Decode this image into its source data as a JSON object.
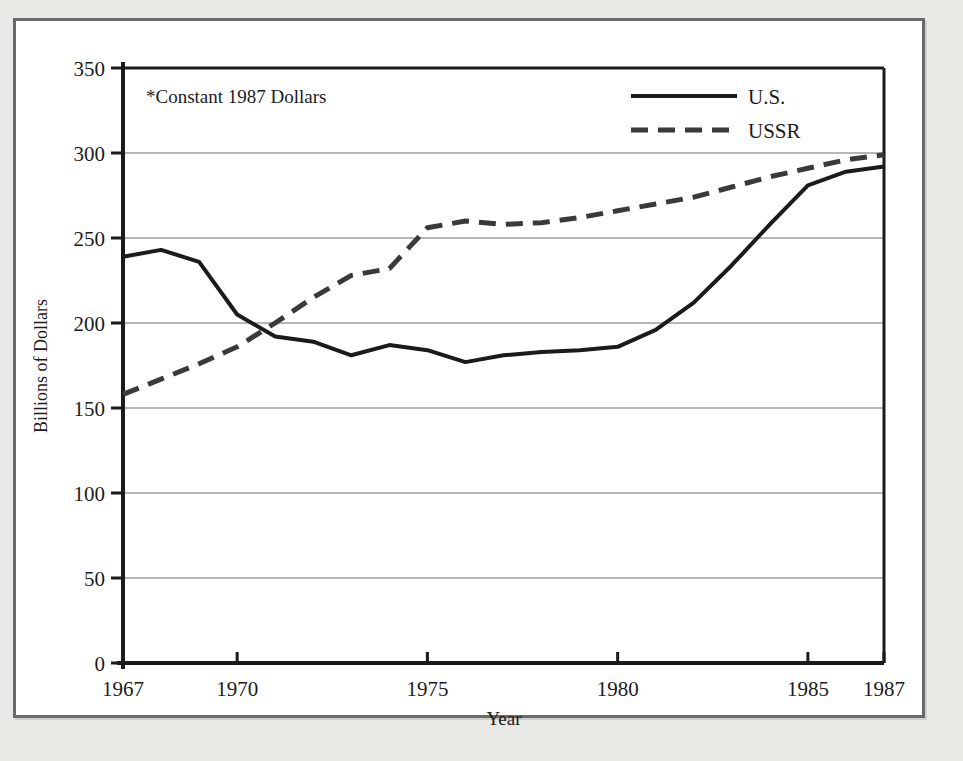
{
  "figure": {
    "note": "*Constant 1987 Dollars",
    "border_color": "#6a6a6a",
    "background": "#ffffff"
  },
  "chart_data": {
    "type": "line",
    "title": "",
    "subtitle": "",
    "annotation": "*Constant 1987 Dollars",
    "xlabel": "Year",
    "ylabel": "Billions of Dollars",
    "xlim": [
      1967,
      1987
    ],
    "ylim": [
      0,
      350
    ],
    "ytick_step": 50,
    "grid": "horizontal",
    "legend_position": "top-right",
    "xticks": [
      1967,
      1970,
      1975,
      1980,
      1985,
      1987
    ],
    "xtick_labels": [
      "1967",
      "1970",
      "1975",
      "1980",
      "1985",
      "1987"
    ],
    "yticks": [
      0,
      50,
      100,
      150,
      200,
      250,
      300,
      350
    ],
    "ytick_labels": [
      "0",
      "50",
      "100",
      "150",
      "200",
      "250",
      "300",
      "350"
    ],
    "x": [
      1967,
      1968,
      1969,
      1970,
      1971,
      1972,
      1973,
      1974,
      1975,
      1976,
      1977,
      1978,
      1979,
      1980,
      1981,
      1982,
      1983,
      1984,
      1985,
      1986,
      1987
    ],
    "series": [
      {
        "name": "U.S.",
        "style": "solid",
        "color": "#1b1b1b",
        "values": [
          239,
          243,
          236,
          205,
          192,
          189,
          181,
          187,
          184,
          177,
          181,
          183,
          184,
          186,
          196,
          212,
          234,
          258,
          281,
          289,
          292
        ]
      },
      {
        "name": "USSR",
        "style": "dashed",
        "color": "#3a3a3a",
        "values": [
          158,
          167,
          176,
          186,
          200,
          215,
          228,
          232,
          256,
          260,
          258,
          259,
          262,
          266,
          270,
          274,
          280,
          286,
          291,
          296,
          299
        ]
      }
    ]
  },
  "legend": {
    "entries": [
      {
        "label": "U.S.",
        "style": "solid"
      },
      {
        "label": "USSR",
        "style": "dashed"
      }
    ]
  },
  "axes": {
    "x_title": "Year",
    "y_title": "Billions of Dollars"
  }
}
